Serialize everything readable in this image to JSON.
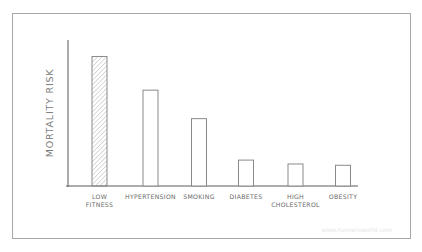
{
  "chart_data": {
    "type": "bar",
    "title": "",
    "xlabel": "",
    "ylabel": "MORTALITY RISK",
    "categories": [
      "LOW FITNESS",
      "HYPERTENSION",
      "SMOKING",
      "DIABETES",
      "HIGH CHOLESTEROL",
      "OBESITY"
    ],
    "category_lines": [
      [
        "LOW",
        "FITNESS"
      ],
      [
        "HYPERTENSION"
      ],
      [
        "SMOKING"
      ],
      [
        "DIABETES"
      ],
      [
        "HIGH",
        "CHOLESTEROL"
      ],
      [
        "OBESITY"
      ]
    ],
    "values": [
      100,
      74,
      52,
      20,
      17,
      16
    ],
    "ylim": [
      0,
      105
    ],
    "grid": false,
    "legend": null,
    "highlighted": [
      0
    ],
    "colors": {
      "stroke": "#8a8a8a",
      "hatch": "#b5b5b5",
      "axis": "#5a5a5a",
      "frame": "#a8a8a8"
    },
    "annotations": []
  },
  "watermark": "www.runnersworld.com"
}
